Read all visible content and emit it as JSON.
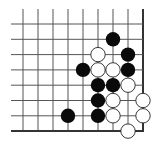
{
  "board": {
    "description": "Go board, bottom-right corner fragment",
    "columns": 9,
    "rows": 8,
    "origin_x": 23,
    "origin_y": 24,
    "spacing_x": 15,
    "spacing_y": 15.3,
    "grid_start_x": 11,
    "grid_start_y": 9,
    "edge_right": true,
    "edge_bottom": true,
    "line_color": "#555555",
    "edge_color": "#333333",
    "stone_radius": 7.2,
    "colors": {
      "black": "#0a0a0a",
      "white": "#ffffff",
      "white_outline": "#222222"
    }
  },
  "stones": [
    {
      "color": "black",
      "col": 6,
      "row": 1
    },
    {
      "color": "white",
      "col": 5,
      "row": 2
    },
    {
      "color": "black",
      "col": 7,
      "row": 2
    },
    {
      "color": "black",
      "col": 4,
      "row": 3
    },
    {
      "color": "white",
      "col": 5,
      "row": 3
    },
    {
      "color": "white",
      "col": 6,
      "row": 3
    },
    {
      "color": "black",
      "col": 7,
      "row": 3
    },
    {
      "color": "black",
      "col": 5,
      "row": 4
    },
    {
      "color": "black",
      "col": 6,
      "row": 4
    },
    {
      "color": "white",
      "col": 7,
      "row": 4
    },
    {
      "color": "black",
      "col": 5,
      "row": 5
    },
    {
      "color": "white",
      "col": 6,
      "row": 5
    },
    {
      "color": "white",
      "col": 8,
      "row": 5
    },
    {
      "color": "black",
      "col": 3,
      "row": 6
    },
    {
      "color": "black",
      "col": 5,
      "row": 6
    },
    {
      "color": "white",
      "col": 6,
      "row": 6
    },
    {
      "color": "white",
      "col": 8,
      "row": 6
    },
    {
      "color": "white",
      "col": 7,
      "row": 7
    }
  ]
}
